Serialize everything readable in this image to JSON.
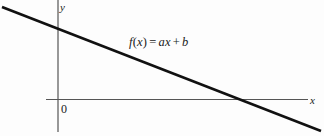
{
  "figure": {
    "background_color": "#fdfdfd",
    "width": 324,
    "height": 136
  },
  "axes": {
    "x_axis_label": "x",
    "y_axis_label": "y",
    "origin_label": "0",
    "axis_color": "#555555",
    "x_axis_y_px": 99.5,
    "y_axis_x_px": 58,
    "x_axis_start_px": 46,
    "x_axis_end_px": 308,
    "y_axis_start_px": 0,
    "y_axis_end_px": 132
  },
  "annotation": {
    "function_label_fx": "f",
    "function_label_open": "(",
    "function_label_var": "x",
    "function_label_close": ")",
    "function_label_equals": "=",
    "function_label_slope": "ax",
    "function_label_plus": "+",
    "function_label_intercept": "b",
    "function_label_full": "f(x) = ax + b"
  },
  "chart_data": {
    "type": "line",
    "title": "",
    "subtitle": "",
    "xlabel": "x",
    "ylabel": "y",
    "legend": [],
    "legend_position": "none",
    "grid": false,
    "annotations": [
      {
        "text": "f(x) = ax + b",
        "x_px": 129,
        "y_px": 36
      }
    ],
    "axis_style": {
      "x_axis_at_y": 0,
      "y_axis_at_x": 0,
      "arrowheads": false,
      "ticks": false,
      "tick_labels": [
        "0"
      ]
    },
    "series": [
      {
        "name": "f(x) = ax + b",
        "kind": "line",
        "color": "#111111",
        "line_width_px": 2.6,
        "description": "Decreasing straight line with negative slope a and positive y-intercept b",
        "points_px": [
          {
            "x": 2,
            "y": 7
          },
          {
            "x": 321,
            "y": 131
          }
        ],
        "y_intercept_px": {
          "x": 58,
          "y": 30
        },
        "x_intercept_px": {
          "x": 250,
          "y": 99.5
        },
        "slope_sign": "negative",
        "intercept_sign": "positive"
      }
    ],
    "xlim_px": [
      0,
      324
    ],
    "ylim_px": [
      0,
      136
    ]
  }
}
